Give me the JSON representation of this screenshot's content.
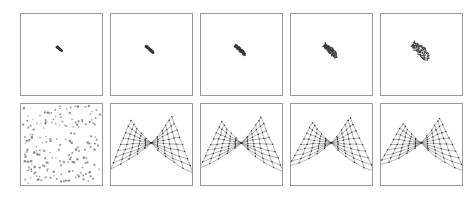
{
  "figure": {
    "title": "",
    "caption": "",
    "background_color": "#ffffff",
    "panel_border_color": "#9a9a9a",
    "mesh_color": "#555555",
    "node_color": "#333333",
    "scatter_color": "#7a7a7a",
    "blob_color": "#3a3a3a",
    "rows": 2,
    "columns": 5,
    "panel_size_px": 83,
    "panel_gap_px": 7
  },
  "chart_data": {
    "type": "scatter",
    "title": "",
    "subtitle": "",
    "xlabel": "",
    "ylabel": "",
    "grid": false,
    "legend_position": "none",
    "panels": [
      {
        "row": 1,
        "column": 1,
        "kind": "collapsed-mesh",
        "stage": 1,
        "spread": 0.08,
        "label": ""
      },
      {
        "row": 1,
        "column": 2,
        "kind": "collapsed-mesh",
        "stage": 2,
        "spread": 0.34,
        "label": ""
      },
      {
        "row": 1,
        "column": 3,
        "kind": "collapsed-mesh",
        "stage": 3,
        "spread": 0.52,
        "label": ""
      },
      {
        "row": 1,
        "column": 4,
        "kind": "collapsed-mesh",
        "stage": 4,
        "spread": 0.74,
        "label": ""
      },
      {
        "row": 1,
        "column": 5,
        "kind": "collapsed-mesh",
        "stage": 5,
        "spread": 1.0,
        "label": ""
      },
      {
        "row": 2,
        "column": 1,
        "kind": "random-scatter",
        "point_count": 185,
        "label": ""
      },
      {
        "row": 2,
        "column": 2,
        "kind": "butterfly-mesh",
        "stage": 1,
        "grid_u": 11,
        "grid_v": 9,
        "twist": 0.9,
        "label": ""
      },
      {
        "row": 2,
        "column": 3,
        "kind": "butterfly-mesh",
        "stage": 2,
        "grid_u": 11,
        "grid_v": 9,
        "twist": 1.0,
        "label": ""
      },
      {
        "row": 2,
        "column": 4,
        "kind": "butterfly-mesh",
        "stage": 3,
        "grid_u": 11,
        "grid_v": 9,
        "twist": 1.1,
        "label": ""
      },
      {
        "row": 2,
        "column": 5,
        "kind": "butterfly-mesh",
        "stage": 4,
        "grid_u": 11,
        "grid_v": 9,
        "twist": 1.2,
        "label": ""
      }
    ]
  }
}
